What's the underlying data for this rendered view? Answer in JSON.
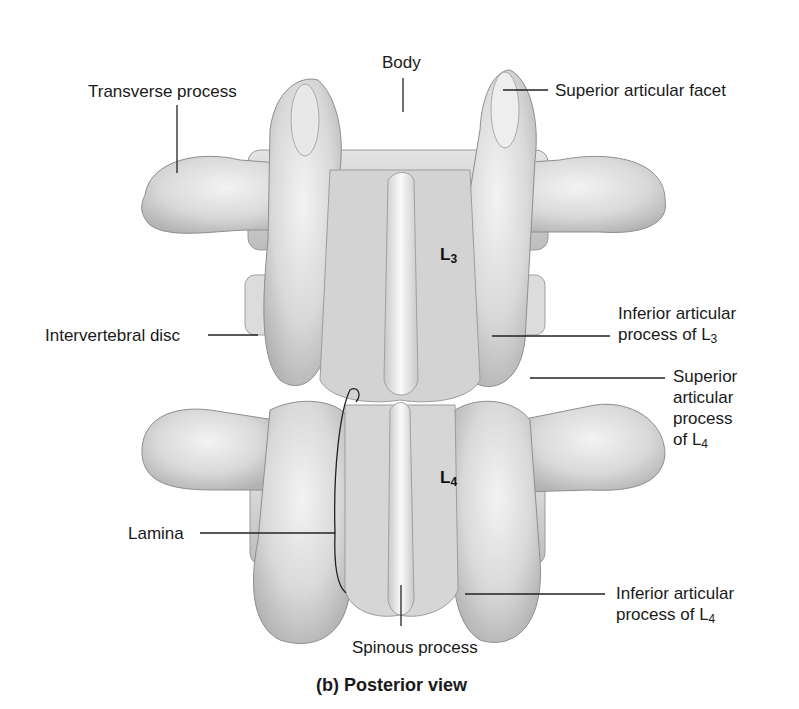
{
  "figure": {
    "caption": "(b) Posterior view"
  },
  "vertebrae": [
    {
      "base": "L",
      "sub": "3"
    },
    {
      "base": "L",
      "sub": "4"
    }
  ],
  "labels": {
    "body": "Body",
    "transverse_process": "Transverse process",
    "superior_articular_facet": "Superior articular facet",
    "intervertebral_disc": "Intervertebral disc",
    "inferior_articular_L3": {
      "line1": "Inferior articular",
      "line2": "process of L",
      "sub": "3"
    },
    "superior_articular_L4": {
      "line1": "Superior",
      "line2": "articular",
      "line3": "process",
      "line4": "of L",
      "sub": "4"
    },
    "lamina": "Lamina",
    "inferior_articular_L4": {
      "line1": "Inferior articular",
      "line2": "process of L",
      "sub": "4"
    },
    "spinous_process": "Spinous process"
  },
  "colors": {
    "bone_light": "#ececec",
    "bone_mid": "#cfcfcf",
    "bone_shadow": "#a9a9a9",
    "leader_line": "#222222",
    "background": "#ffffff"
  }
}
